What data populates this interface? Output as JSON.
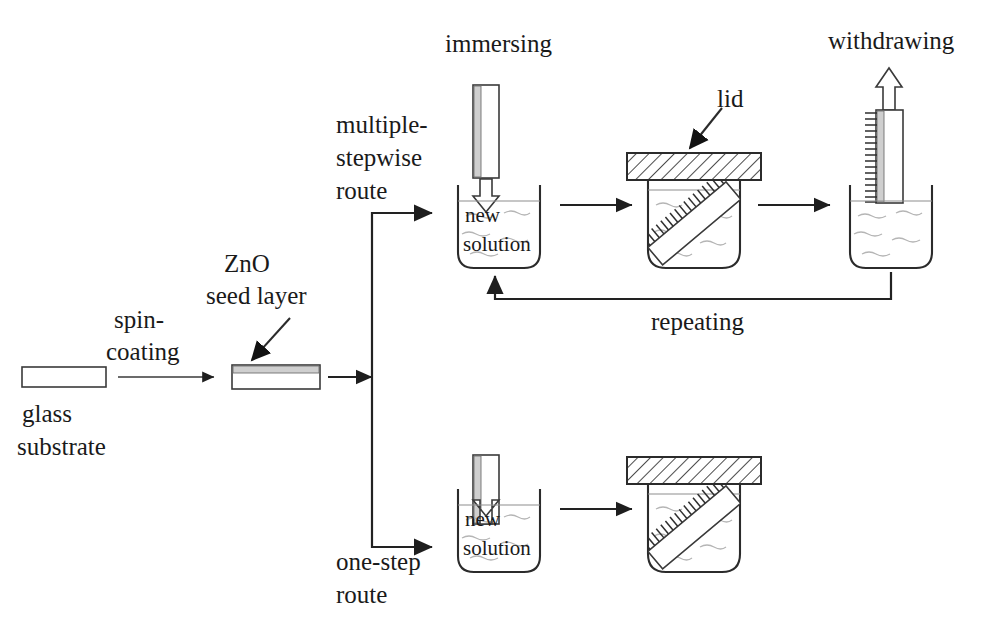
{
  "figure": {
    "type": "process-flow-diagram",
    "background_color": "#ffffff",
    "ink_color": "#1a1a1a"
  },
  "labels": {
    "glass_substrate": "glass\nsubstrate",
    "glass_substrate_line1": "glass",
    "glass_substrate_line2": "substrate",
    "spin_coating_line1": "spin-",
    "spin_coating_line2": "coating",
    "zno_line1": "ZnO",
    "zno_line2": "seed layer",
    "multiple_line1": "multiple-",
    "multiple_line2": "stepwise",
    "multiple_line3": "route",
    "one_step_line1": "one-step",
    "one_step_line2": "route",
    "immersing": "immersing",
    "lid": "lid",
    "withdrawing": "withdrawing",
    "repeating": "repeating",
    "new_solution_line1": "new",
    "new_solution_line2": "solution"
  },
  "stages": {
    "start": {
      "name": "glass-substrate",
      "caption_line1": "glass",
      "caption_line2": "substrate"
    },
    "spin_coating_arrow": {
      "name": "spin-coating-arrow",
      "label_line1": "spin-",
      "label_line2": "coating"
    },
    "seeded": {
      "name": "seeded-substrate",
      "annotation_line1": "ZnO",
      "annotation_line2": "seed layer"
    },
    "branch": {
      "name": "route-branch",
      "upper_route_line1": "multiple-",
      "upper_route_line2": "stepwise",
      "upper_route_line3": "route",
      "lower_route_line1": "one-step",
      "lower_route_line2": "route"
    },
    "upper_row": [
      {
        "name": "immersing-beaker",
        "title": "immersing",
        "beaker_text_line1": "new",
        "beaker_text_line2": "solution"
      },
      {
        "name": "covered-beaker-growth",
        "title": "lid"
      },
      {
        "name": "withdrawing-beaker",
        "title": "withdrawing"
      }
    ],
    "lower_row": [
      {
        "name": "immersing-beaker-one-step",
        "beaker_text_line1": "new",
        "beaker_text_line2": "solution"
      },
      {
        "name": "covered-beaker-growth-one-step"
      }
    ],
    "feedback": {
      "name": "repeating-loop",
      "label": "repeating"
    }
  },
  "colors": {
    "ink": "#1a1a1a",
    "stroke": "#2b2b2b",
    "thin_stroke": "#3a3a3a",
    "liquid": "#8d8d8d",
    "wave": "#b5b5b5",
    "seed_band": "#cfcfcf",
    "paper": "#ffffff"
  }
}
